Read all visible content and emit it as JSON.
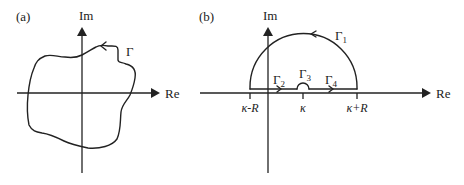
{
  "figure": {
    "panels": [
      {
        "id": "a",
        "label": "(a)",
        "axes": {
          "imag_label": "Im",
          "real_label": "Re"
        },
        "contour": {
          "label": "Γ",
          "description": "arbitrary closed contour enclosing the origin, oriented counterclockwise"
        }
      },
      {
        "id": "b",
        "label": "(b)",
        "axes": {
          "imag_label": "Im",
          "real_label": "Re"
        },
        "contour_segments": [
          {
            "name": "Γ",
            "subscript": "1",
            "description": "upper semicircular arc of radius R centered at κ"
          },
          {
            "name": "Γ",
            "subscript": "2",
            "description": "segment along real axis from κ-R to κ"
          },
          {
            "name": "Γ",
            "subscript": "3",
            "description": "small semicircular indentation above κ"
          },
          {
            "name": "Γ",
            "subscript": "4",
            "description": "segment along real axis from κ to κ+R"
          }
        ],
        "ticks": [
          {
            "label": "κ-R"
          },
          {
            "label": "κ"
          },
          {
            "label": "κ+R"
          }
        ]
      }
    ],
    "colors": {
      "ink": "#222222",
      "background": "#ffffff"
    }
  }
}
